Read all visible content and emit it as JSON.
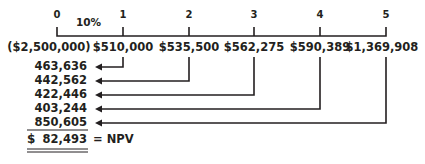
{
  "diagram": {
    "type": "cash-flow-timeline",
    "discount_rate_label": "10%",
    "periods": [
      "0",
      "1",
      "2",
      "3",
      "4",
      "5"
    ],
    "cash_flows": [
      "($2,500,000)",
      "$510,000",
      "$535,500",
      "$562,275",
      "$590,389",
      "$1,369,908"
    ],
    "present_values": [
      "463,636",
      "442,562",
      "422,446",
      "403,244",
      "850,605"
    ],
    "npv": {
      "currency_symbol": "$",
      "value": "82,493",
      "label": "= NPV"
    },
    "line_color": "#231f20"
  }
}
